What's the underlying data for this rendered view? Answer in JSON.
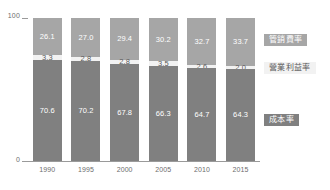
{
  "chart_data": {
    "type": "bar",
    "stacked": true,
    "stack_total": 100,
    "title": "",
    "subtitle": "",
    "xlabel": "",
    "ylabel": "",
    "categories": [
      "1990",
      "1995",
      "2000",
      "2005",
      "2010",
      "2015"
    ],
    "ylim": [
      0,
      100
    ],
    "ytick_labels": [
      "0",
      "100"
    ],
    "grid": false,
    "legend_position": "right",
    "series": [
      {
        "name": "管銷費率",
        "key": "expense",
        "color": "#a6a6a6",
        "values": [
          26.1,
          27.0,
          29.4,
          30.2,
          32.7,
          33.7
        ]
      },
      {
        "name": "營業利益率",
        "key": "profit",
        "color": "#f2f2f2",
        "values": [
          3.3,
          2.8,
          2.8,
          3.5,
          2.6,
          2.0
        ]
      },
      {
        "name": "成本率",
        "key": "cost",
        "color": "#808080",
        "values": [
          70.6,
          70.2,
          67.8,
          66.3,
          64.7,
          64.3
        ]
      }
    ],
    "value_labels": {
      "expense": [
        "26.1",
        "27.0",
        "29.4",
        "30.2",
        "32.7",
        "33.7"
      ],
      "profit": [
        "3.3",
        "2.8",
        "2.8",
        "3.5",
        "2.6",
        "2.0"
      ],
      "cost": [
        "70.6",
        "70.2",
        "67.8",
        "66.3",
        "64.7",
        "64.3"
      ]
    }
  },
  "axis": {
    "y_top": "100",
    "y_bottom": "0"
  },
  "legend": {
    "expense_label": "管銷費率",
    "profit_label": "營業利益率",
    "cost_label": "成本率"
  }
}
